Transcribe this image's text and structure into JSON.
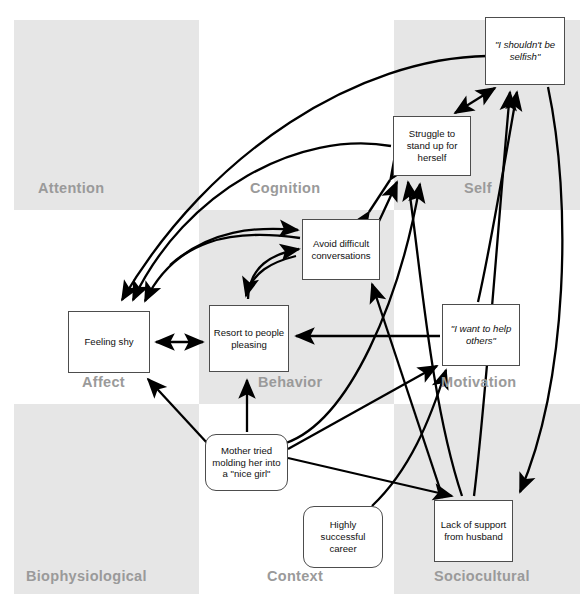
{
  "diagram": {
    "grid": {
      "cells": [
        {
          "key": "attention",
          "label": "Attention",
          "shaded": true,
          "x": 14,
          "y": 20,
          "w": 185,
          "h": 190,
          "lx": 38,
          "ly": 180
        },
        {
          "key": "cognition",
          "label": "Cognition",
          "shaded": false,
          "x": 199,
          "y": 20,
          "w": 195,
          "h": 190,
          "lx": 250,
          "ly": 180
        },
        {
          "key": "self",
          "label": "Self",
          "shaded": true,
          "x": 394,
          "y": 20,
          "w": 186,
          "h": 190,
          "lx": 464,
          "ly": 180
        },
        {
          "key": "affect",
          "label": "Affect",
          "shaded": false,
          "x": 14,
          "y": 210,
          "w": 185,
          "h": 194,
          "lx": 82,
          "ly": 374
        },
        {
          "key": "behavior",
          "label": "Behavior",
          "shaded": true,
          "x": 199,
          "y": 210,
          "w": 195,
          "h": 194,
          "lx": 258,
          "ly": 374
        },
        {
          "key": "motivation",
          "label": "Motivation",
          "shaded": false,
          "x": 394,
          "y": 210,
          "w": 186,
          "h": 194,
          "lx": 441,
          "ly": 374
        },
        {
          "key": "biophysiological",
          "label": "Biophysiological",
          "shaded": true,
          "x": 14,
          "y": 404,
          "w": 185,
          "h": 190,
          "lx": 26,
          "ly": 568
        },
        {
          "key": "context",
          "label": "Context",
          "shaded": false,
          "x": 199,
          "y": 404,
          "w": 195,
          "h": 190,
          "lx": 267,
          "ly": 568
        },
        {
          "key": "sociocultural",
          "label": "Sociocultural",
          "shaded": true,
          "x": 394,
          "y": 404,
          "w": 186,
          "h": 190,
          "lx": 434,
          "ly": 568
        }
      ]
    },
    "nodes": [
      {
        "key": "shouldnt-be-selfish",
        "text": "\"I shouldn't be selfish\"",
        "x": 485,
        "y": 17,
        "w": 80,
        "h": 68,
        "shape": "rect",
        "italic": true
      },
      {
        "key": "struggle-to-stand-up",
        "text": "Struggle to stand up for herself",
        "x": 393,
        "y": 116,
        "w": 78,
        "h": 60,
        "shape": "rect",
        "italic": false
      },
      {
        "key": "avoid-difficult-conversations",
        "text": "Avoid difficult conversations",
        "x": 302,
        "y": 219,
        "w": 78,
        "h": 61,
        "shape": "rect",
        "italic": false
      },
      {
        "key": "feeling-shy",
        "text": "Feeling shy",
        "x": 68,
        "y": 311,
        "w": 82,
        "h": 62,
        "shape": "rect",
        "italic": false
      },
      {
        "key": "resort-to-people-pleasing",
        "text": "Resort to people pleasing",
        "x": 209,
        "y": 305,
        "w": 80,
        "h": 67,
        "shape": "rect",
        "italic": false
      },
      {
        "key": "i-want-to-help-others",
        "text": "\"I want to help others\"",
        "x": 442,
        "y": 304,
        "w": 78,
        "h": 62,
        "shape": "rect",
        "italic": true
      },
      {
        "key": "mother-tried-molding",
        "text": "Mother tried molding her into a \"nice girl\"",
        "x": 205,
        "y": 434,
        "w": 83,
        "h": 57,
        "shape": "rounded",
        "italic": false
      },
      {
        "key": "highly-successful-career",
        "text": "Highly successful career",
        "x": 303,
        "y": 506,
        "w": 80,
        "h": 62,
        "shape": "rounded",
        "italic": false
      },
      {
        "key": "lack-of-support-from-husband",
        "text": "Lack of support from husband",
        "x": 434,
        "y": 500,
        "w": 79,
        "h": 62,
        "shape": "rect",
        "italic": false
      }
    ],
    "edges": [
      {
        "from": "shouldnt-be-selfish",
        "to": "feeling-shy",
        "style": "curved",
        "arrow": "single"
      },
      {
        "from": "shouldnt-be-selfish",
        "to": "struggle-to-stand-up",
        "style": "straight",
        "arrow": "double"
      },
      {
        "from": "struggle-to-stand-up",
        "to": "feeling-shy",
        "style": "curved",
        "arrow": "single"
      },
      {
        "from": "struggle-to-stand-up",
        "to": "avoid-difficult-conversations",
        "style": "straight",
        "arrow": "double"
      },
      {
        "from": "avoid-difficult-conversations",
        "to": "feeling-shy",
        "style": "curved",
        "arrow": "single"
      },
      {
        "from": "avoid-difficult-conversations",
        "to": "resort-to-people-pleasing",
        "style": "curved",
        "arrow": "double"
      },
      {
        "from": "feeling-shy",
        "to": "resort-to-people-pleasing",
        "style": "straight",
        "arrow": "double"
      },
      {
        "from": "i-want-to-help-others",
        "to": "resort-to-people-pleasing",
        "style": "straight",
        "arrow": "single"
      },
      {
        "from": "i-want-to-help-others",
        "to": "shouldnt-be-selfish",
        "style": "curved",
        "arrow": "single"
      },
      {
        "from": "mother-tried-molding",
        "to": "feeling-shy",
        "style": "straight",
        "arrow": "single"
      },
      {
        "from": "mother-tried-molding",
        "to": "resort-to-people-pleasing",
        "style": "straight",
        "arrow": "single"
      },
      {
        "from": "mother-tried-molding",
        "to": "struggle-to-stand-up",
        "style": "straight",
        "arrow": "single"
      },
      {
        "from": "mother-tried-molding",
        "to": "i-want-to-help-others",
        "style": "straight",
        "arrow": "single"
      },
      {
        "from": "mother-tried-molding",
        "to": "lack-of-support-from-husband",
        "style": "straight",
        "arrow": "single"
      },
      {
        "from": "highly-successful-career",
        "to": "i-want-to-help-others",
        "style": "straight",
        "arrow": "single"
      },
      {
        "from": "lack-of-support-from-husband",
        "to": "avoid-difficult-conversations",
        "style": "straight",
        "arrow": "single"
      },
      {
        "from": "lack-of-support-from-husband",
        "to": "struggle-to-stand-up",
        "style": "straight",
        "arrow": "single"
      },
      {
        "from": "lack-of-support-from-husband",
        "to": "shouldnt-be-selfish",
        "style": "straight",
        "arrow": "single"
      },
      {
        "from": "shouldnt-be-selfish",
        "to": "lack-of-support-from-husband",
        "style": "curved",
        "arrow": "single"
      }
    ],
    "colors": {
      "cell_shaded": "#e6e6e6",
      "cell_label": "#9a9a9a",
      "node_border": "#4d4d4d",
      "node_fill": "#ffffff",
      "edge": "#000000",
      "page": "#ffffff"
    }
  }
}
